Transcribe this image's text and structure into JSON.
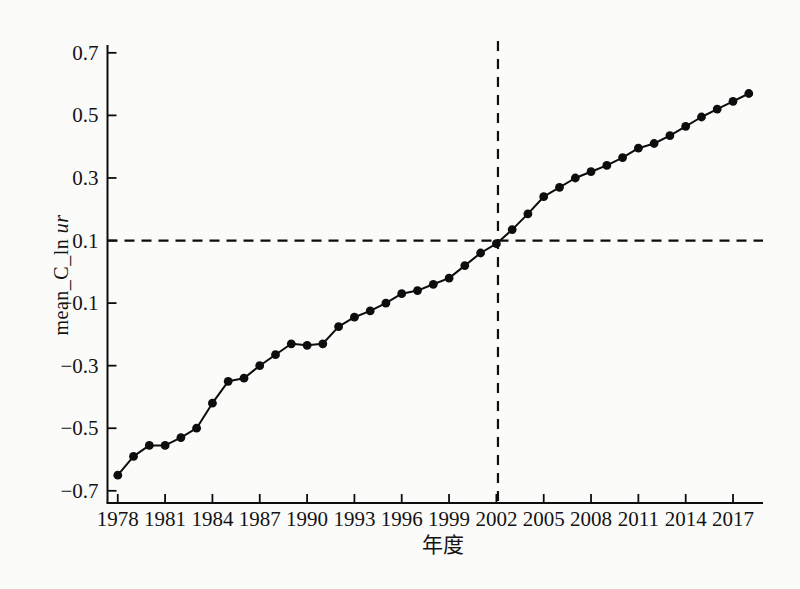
{
  "figure": {
    "background": "#fbfbfa",
    "ink": "#0d0d0d"
  },
  "chart_data": {
    "type": "line",
    "title": "",
    "xlabel": "年度",
    "ylabel": "mean_C_ln ur",
    "ylabel_regular": "mean_C_ln ",
    "ylabel_italic": "ur",
    "x": [
      1978,
      1979,
      1980,
      1981,
      1982,
      1983,
      1984,
      1985,
      1986,
      1987,
      1988,
      1989,
      1990,
      1991,
      1992,
      1993,
      1994,
      1995,
      1996,
      1997,
      1998,
      1999,
      2000,
      2001,
      2002,
      2003,
      2004,
      2005,
      2006,
      2007,
      2008,
      2009,
      2010,
      2011,
      2012,
      2013,
      2014,
      2015,
      2016,
      2017,
      2018
    ],
    "series": [
      {
        "name": "mean_C_ln ur",
        "values": [
          -0.65,
          -0.59,
          -0.555,
          -0.555,
          -0.53,
          -0.5,
          -0.42,
          -0.35,
          -0.34,
          -0.3,
          -0.265,
          -0.23,
          -0.235,
          -0.23,
          -0.175,
          -0.145,
          -0.125,
          -0.1,
          -0.07,
          -0.06,
          -0.04,
          -0.02,
          0.02,
          0.06,
          0.09,
          0.135,
          0.185,
          0.24,
          0.27,
          0.3,
          0.32,
          0.34,
          0.365,
          0.395,
          0.41,
          0.435,
          0.465,
          0.495,
          0.52,
          0.545,
          0.57
        ]
      }
    ],
    "x_ticks": [
      1978,
      1981,
      1984,
      1987,
      1990,
      1993,
      1996,
      1999,
      2002,
      2005,
      2008,
      2011,
      2014,
      2017
    ],
    "y_ticks": [
      0.7,
      0.5,
      0.3,
      0.1,
      -0.1,
      -0.3,
      -0.5,
      -0.7
    ],
    "x_range": [
      1977.35,
      2018.9
    ],
    "y_range": [
      -0.739,
      0.725
    ],
    "reference_lines": {
      "horizontal_y": 0.1,
      "vertical_x": 2002.1
    },
    "grid": false,
    "legend": "none",
    "marker": "filled-circle",
    "line_color": "#0d0d0d",
    "line_style": "solid",
    "reference_line_style": "dashed"
  }
}
